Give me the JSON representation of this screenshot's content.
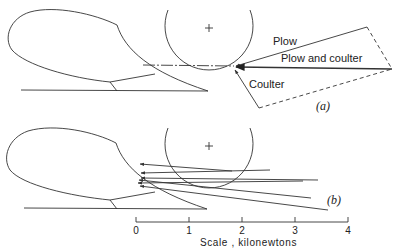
{
  "diagram": {
    "panel_a": {
      "label": "(a)",
      "forces": {
        "plow": "Plow",
        "resultant": "Plow and coulter",
        "coulter": "Coulter"
      }
    },
    "panel_b": {
      "label": "(b)",
      "force_line_count": 6
    },
    "scale": {
      "caption": "Scale , kilonewtons",
      "ticks": [
        "0",
        "1",
        "2",
        "3",
        "4"
      ],
      "unit": "kilonewtons",
      "range": [
        0,
        4
      ]
    },
    "colors": {
      "line": "#333333",
      "background": "#ffffff"
    }
  }
}
